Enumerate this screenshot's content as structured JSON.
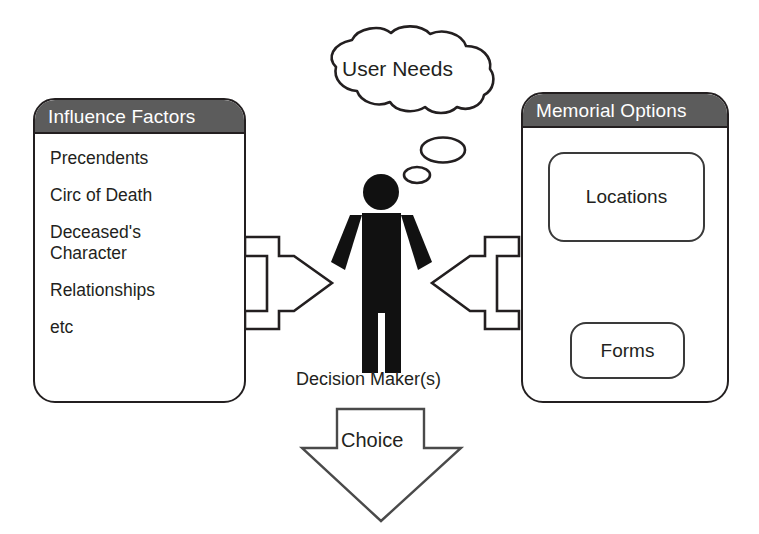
{
  "diagram": {
    "title_left": "Influence Factors",
    "title_right": "Memorial Options",
    "influence_factors": [
      "Precendents",
      "Circ of Death",
      "Deceased's\nCharacter",
      "Relationships",
      "etc"
    ],
    "memorial_options": {
      "locations_label": "Locations",
      "forms_label": "Forms"
    },
    "thought_bubble": "User Needs",
    "actor_label": "Decision Maker(s)",
    "outcome_label": "Choice",
    "colors": {
      "header_fill": "#5c5c5c",
      "header_text": "#ffffff",
      "outline": "#231f20",
      "body_text": "#231f20",
      "background": "#ffffff",
      "figure_fill": "#111111"
    },
    "icons": {
      "person": "person-figure-icon",
      "arrow_left_to_center": "arrow-right-outline-icon",
      "arrow_right_to_center": "arrow-left-outline-icon",
      "arrow_down_filled": "arrow-down-filled-icon",
      "arrow_up_filled": "arrow-up-filled-icon",
      "arrow_choice": "arrow-down-outline-icon",
      "thought_cloud": "thought-cloud-icon",
      "thought_dot_large": "thought-ellipse-large-icon",
      "thought_dot_small": "thought-ellipse-small-icon"
    }
  }
}
